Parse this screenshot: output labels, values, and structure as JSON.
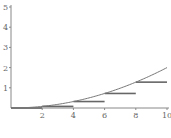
{
  "chart_data": {
    "type": "line",
    "title": "",
    "xlabel": "",
    "ylabel": "",
    "xlim": [
      0,
      10
    ],
    "ylim": [
      0,
      5
    ],
    "grid": false,
    "x_ticks": [
      "2",
      "4",
      "6",
      "8",
      "10"
    ],
    "y_ticks": [
      "1",
      "2",
      "3",
      "4",
      "5"
    ],
    "series": [
      {
        "name": "curve",
        "kind": "line",
        "function": "x^2/50",
        "x": [
          0,
          1,
          2,
          3,
          4,
          5,
          6,
          7,
          8,
          9,
          10
        ],
        "y": [
          0,
          0.02,
          0.08,
          0.18,
          0.32,
          0.5,
          0.72,
          0.98,
          1.28,
          1.62,
          2.0
        ]
      },
      {
        "name": "left-riemann-steps",
        "kind": "step",
        "segments": [
          {
            "x0": 0,
            "x1": 2,
            "y": 0
          },
          {
            "x0": 2,
            "x1": 4,
            "y": 0.08
          },
          {
            "x0": 4,
            "x1": 6,
            "y": 0.32
          },
          {
            "x0": 6,
            "x1": 8,
            "y": 0.72
          },
          {
            "x0": 8,
            "x1": 10,
            "y": 1.28
          }
        ]
      }
    ],
    "colors": {
      "axis": "#888888",
      "curve": "#777777",
      "steps": "#666666",
      "labels": "#666666"
    }
  }
}
